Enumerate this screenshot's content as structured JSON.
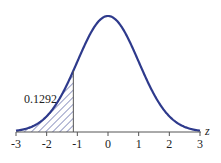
{
  "chart_data": {
    "type": "area",
    "title": "",
    "xlabel": "z",
    "ylabel": "",
    "xlim": [
      -3,
      3
    ],
    "x_ticks": [
      "-3",
      "-2",
      "-1",
      "0",
      "1",
      "2",
      "3"
    ],
    "curve": "standard normal density",
    "shaded_region": {
      "from": -3,
      "to": -1.13,
      "pattern": "diagonal hatch"
    },
    "annotation": "0.1292",
    "grid": false,
    "legend": null
  },
  "colors": {
    "curve": "#2e3a8c",
    "axis": "#555555"
  }
}
